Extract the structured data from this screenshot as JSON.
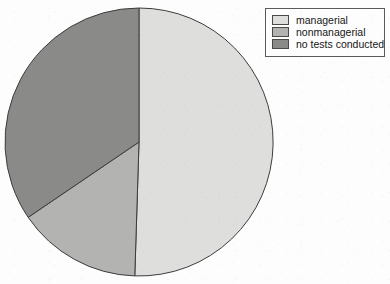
{
  "figure": {
    "background_color": "#fdfdfd",
    "width": 390,
    "height": 284
  },
  "chart_data": {
    "type": "pie",
    "title": "",
    "labels": [
      "managerial",
      "nonmanagerial",
      "no tests conducted"
    ],
    "values": [
      50.5,
      15.0,
      34.5
    ],
    "units": "percent",
    "colors": [
      "#dededd",
      "#b3b3b2",
      "#8a8a89"
    ],
    "edge_color": "#3c3c3c",
    "start_angle_deg": 90,
    "direction": "clockwise",
    "legend": {
      "position": "top-right",
      "border_color": "#5a5a5a",
      "background": "#fdfdfd",
      "entries": [
        {
          "label": "managerial",
          "swatch_color": "#dededd"
        },
        {
          "label": "nonmanagerial",
          "swatch_color": "#b3b3b2"
        },
        {
          "label": "no tests conducted",
          "swatch_color": "#8a8a89"
        }
      ]
    },
    "geometry": {
      "center_x": 139,
      "center_y": 142,
      "radius": 134
    }
  },
  "legend": {
    "items": [
      {
        "label": "managerial"
      },
      {
        "label": "nonmanagerial"
      },
      {
        "label": "no tests conducted"
      }
    ]
  }
}
